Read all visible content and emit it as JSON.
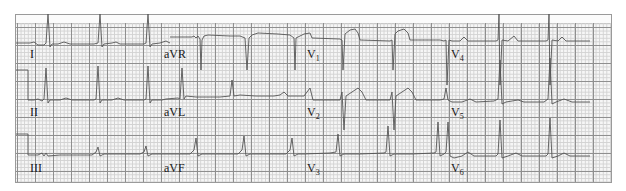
{
  "ecg": {
    "title": "12-lead ECG",
    "leads": {
      "row1": [
        {
          "id": "I",
          "label": "I"
        },
        {
          "id": "aVR",
          "label": "aVR"
        },
        {
          "id": "V1",
          "label": "V",
          "sub": "1"
        },
        {
          "id": "V4",
          "label": "V",
          "sub": "4"
        }
      ],
      "row2": [
        {
          "id": "II",
          "label": "II"
        },
        {
          "id": "aVL",
          "label": "aVL"
        },
        {
          "id": "V2",
          "label": "V",
          "sub": "2"
        },
        {
          "id": "V5",
          "label": "V",
          "sub": "5"
        }
      ],
      "row3": [
        {
          "id": "III",
          "label": "III"
        },
        {
          "id": "aVF",
          "label": "aVF"
        },
        {
          "id": "V3",
          "label": "V",
          "sub": "3"
        },
        {
          "id": "V6",
          "label": "V",
          "sub": "6"
        }
      ]
    },
    "colors": {
      "trace": "#555555",
      "grid_major": "#8f8f8f",
      "grid_minor": "#d2d2d2",
      "paper": "#f6f6f6"
    }
  }
}
